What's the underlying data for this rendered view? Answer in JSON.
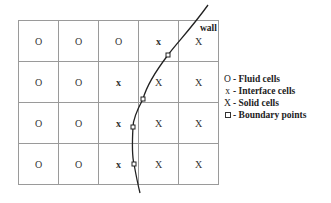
{
  "grid": {
    "rows": 4,
    "cols": 5,
    "cells": [
      [
        "O",
        "O",
        "O",
        "x",
        "X"
      ],
      [
        "O",
        "O",
        "x",
        "X",
        "X"
      ],
      [
        "O",
        "O",
        "x",
        "X",
        "X"
      ],
      [
        "O",
        "O",
        "x",
        "X",
        "X"
      ]
    ]
  },
  "wall": {
    "label": "wall"
  },
  "legend": {
    "items": [
      {
        "symbol": "O",
        "label": "- Fluid cells"
      },
      {
        "symbol": "x",
        "label": "- Interface cells"
      },
      {
        "symbol": "X",
        "label": "- Solid cells"
      },
      {
        "symbol": "box",
        "label": "- Boundary points"
      }
    ]
  },
  "colors": {
    "grid_line": "#999999",
    "curve": "#222222",
    "text": "#333333"
  }
}
